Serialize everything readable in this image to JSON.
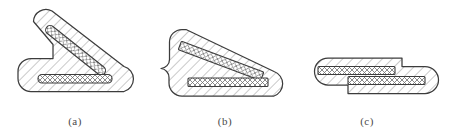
{
  "figure": {
    "background_color": "#ffffff",
    "outline_color": "#3c3c3c",
    "hatch_color": "#8a8a8a",
    "slot_fill_color": "#ffffff",
    "caption_color": "#4a4a4a",
    "width": 453,
    "height": 131
  },
  "panels": [
    {
      "id": "a",
      "caption": "(a)",
      "state_label": "open",
      "body_name": "bent-arm-body",
      "slots": [
        {
          "name": "upper-diagonal-slot",
          "pattern": "cross-hatch"
        },
        {
          "name": "lower-horizontal-slot",
          "pattern": "cross-hatch"
        }
      ]
    },
    {
      "id": "b",
      "caption": "(b)",
      "state_label": "partially-folded",
      "body_name": "partially-folded-body",
      "slots": [
        {
          "name": "upper-diagonal-slot",
          "pattern": "cross-hatch"
        },
        {
          "name": "lower-horizontal-slot",
          "pattern": "cross-hatch"
        }
      ]
    },
    {
      "id": "c",
      "caption": "(c)",
      "state_label": "closed",
      "body_name": "closed-stacked-body",
      "slots": [
        {
          "name": "upper-horizontal-slot",
          "pattern": "cross-hatch"
        },
        {
          "name": "lower-horizontal-slot",
          "pattern": "cross-hatch"
        }
      ]
    }
  ]
}
